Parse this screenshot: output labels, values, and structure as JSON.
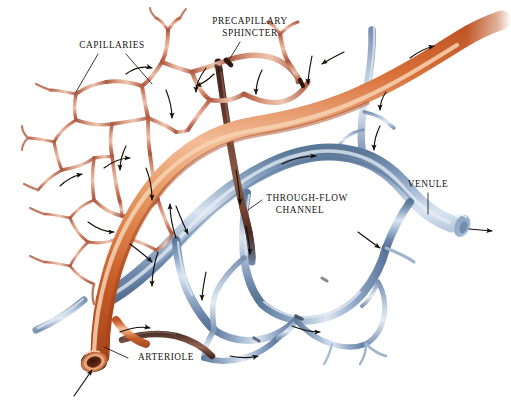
{
  "figure": {
    "background_color": "#ffffff",
    "width": 511,
    "height": 403
  },
  "palette": {
    "arteriole_orange": "#d0612c",
    "arteriole_orange_light": "#e89a6b",
    "arteriole_highlight": "#f6cdae",
    "capillary_salmon": "#c4715a",
    "capillary_salmon_light": "#dd9a80",
    "venule_blue": "#7e99bd",
    "venule_blue_light": "#b9cadd",
    "venule_highlight": "#e2eaf3",
    "through_flow_maroon": "#55322a",
    "label_text": "#17120f",
    "leader_line": "#1a1410",
    "flow_arrow": "#120e0b"
  },
  "labels": [
    {
      "id": "capillaries",
      "text": "CAPILLARIES",
      "x": 112,
      "y": 46,
      "leader_targets": 2,
      "description": "Points to two thin salmon-colored capillary vessels in the upper-left network"
    },
    {
      "id": "precapillary-sphincter",
      "line1": "PRECAPILLARY",
      "line2": "SPHINCTER",
      "x": 250,
      "y": 22,
      "leader_targets": 1,
      "description": "Points down to a dark constricting band at a capillary origin"
    },
    {
      "id": "through-flow-channel",
      "line1": "THROUGH-FLOW",
      "line2": "CHANNEL",
      "x": 307,
      "y": 199,
      "leader_targets": 1,
      "description": "Points left to the dark maroon metarteriole passing between arteriole and venule"
    },
    {
      "id": "venule",
      "text": "VENULE",
      "x": 428,
      "y": 185,
      "leader_targets": 1,
      "description": "Points down to the large blue venule trunk on the right"
    },
    {
      "id": "arteriole",
      "text": "ARTERIOLE",
      "x": 166,
      "y": 358,
      "leader_targets": 1,
      "description": "Points left to the thick orange arteriole with open cut end at lower left"
    }
  ],
  "vessels": [
    {
      "id": "arteriole-trunk",
      "type": "arteriole",
      "color": "#d0612c",
      "description": "Thick orange arteriole entering at lower-left cut end, sweeping up and right to exit top-right edge"
    },
    {
      "id": "capillary-network",
      "type": "capillary",
      "color": "#c4715a",
      "description": "Fine salmon branching mesh of anastomosing loops filling the upper-left quadrant"
    },
    {
      "id": "venule-trunk",
      "type": "venule",
      "color": "#7e99bd",
      "description": "Thick blue venule collecting from the network and exiting right with an open cut end"
    },
    {
      "id": "through-flow-channel-vessel",
      "type": "metarteriole",
      "color": "#55322a",
      "description": "Dark maroon preferential channel descending from arteriole to venule through the center"
    },
    {
      "id": "venous-capillary-network",
      "type": "venule-branch",
      "color": "#9db3cd",
      "description": "Pale blue venous capillary loops in the lower-center and lower-right"
    }
  ],
  "flow_indicators": {
    "name": "blood-flow-arrows",
    "count": 26,
    "color": "#120e0b",
    "description": "Small curved arrows along the vessels indicating direction of blood flow; arteriole inflow at lower-left, venule outflow at right"
  },
  "open_ends": [
    {
      "id": "arteriole-cut-end",
      "x": 92,
      "y": 362,
      "color": "#8c3b1c",
      "arrow": "inflow"
    },
    {
      "id": "venule-cut-end",
      "x": 464,
      "y": 227,
      "color": "#8da6c4",
      "arrow": "outflow"
    }
  ]
}
